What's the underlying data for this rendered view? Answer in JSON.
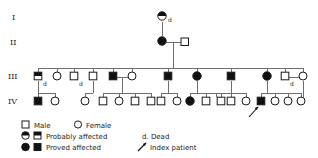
{
  "figure": {
    "type": "pedigree-chart",
    "width": 318,
    "height": 158,
    "background_color": "#ffffff",
    "line_color": "#6e6e6e",
    "symbol_stroke_color": "#1a1a1a",
    "filled_color": "#111111"
  },
  "generation_labels": [
    {
      "id": "gen-I",
      "text": "I",
      "x": 13,
      "y": 20
    },
    {
      "id": "gen-II",
      "text": "II",
      "x": 12,
      "y": 45
    },
    {
      "id": "gen-III",
      "text": "III",
      "x": 10,
      "y": 78
    },
    {
      "id": "gen-IV",
      "text": "IV",
      "x": 10,
      "y": 103
    }
  ],
  "dead_marks": [
    {
      "text": "d",
      "x": 168,
      "y": 21
    },
    {
      "text": "d",
      "x": 43,
      "y": 84
    },
    {
      "text": "d",
      "x": 78,
      "y": 84
    },
    {
      "text": "d",
      "x": 288,
      "y": 84
    }
  ],
  "individuals": [
    {
      "id": "I-1",
      "generation": "I",
      "sex": "female",
      "status": "probably-affected",
      "x": 162,
      "y": 16,
      "dead": true
    },
    {
      "id": "II-1",
      "generation": "II",
      "sex": "female",
      "status": "proved-affected",
      "x": 162,
      "y": 41,
      "dead": false
    },
    {
      "id": "II-2",
      "generation": "II",
      "sex": "male",
      "status": "unaffected",
      "x": 185,
      "y": 41,
      "dead": false
    },
    {
      "id": "III-1",
      "generation": "III",
      "sex": "male",
      "status": "probably-affected",
      "x": 38,
      "y": 76,
      "dead": true
    },
    {
      "id": "III-2",
      "generation": "III",
      "sex": "female",
      "status": "unaffected",
      "x": 57,
      "y": 76,
      "dead": false
    },
    {
      "id": "III-3",
      "generation": "III",
      "sex": "male",
      "status": "unaffected",
      "x": 74,
      "y": 76,
      "dead": true
    },
    {
      "id": "III-4",
      "generation": "III",
      "sex": "male",
      "status": "unaffected",
      "x": 93,
      "y": 76,
      "dead": false
    },
    {
      "id": "III-5",
      "generation": "III",
      "sex": "male",
      "status": "proved-affected",
      "x": 113,
      "y": 76,
      "dead": false
    },
    {
      "id": "III-6",
      "generation": "III",
      "sex": "female",
      "status": "unaffected",
      "x": 132,
      "y": 76,
      "dead": false
    },
    {
      "id": "III-7",
      "generation": "III",
      "sex": "male",
      "status": "proved-affected",
      "x": 168,
      "y": 76,
      "dead": false
    },
    {
      "id": "III-8",
      "generation": "III",
      "sex": "female",
      "status": "proved-affected",
      "x": 197,
      "y": 76,
      "dead": false
    },
    {
      "id": "III-9",
      "generation": "III",
      "sex": "male",
      "status": "proved-affected",
      "x": 231,
      "y": 76,
      "dead": false
    },
    {
      "id": "III-10",
      "generation": "III",
      "sex": "female",
      "status": "proved-affected",
      "x": 267,
      "y": 76,
      "dead": false
    },
    {
      "id": "III-11",
      "generation": "III",
      "sex": "male",
      "status": "unaffected",
      "x": 285,
      "y": 76,
      "dead": true
    },
    {
      "id": "III-12",
      "generation": "III",
      "sex": "female",
      "status": "unaffected",
      "x": 303,
      "y": 76,
      "dead": false
    },
    {
      "id": "IV-1",
      "generation": "IV",
      "sex": "male",
      "status": "proved-affected",
      "x": 38,
      "y": 101,
      "dead": false
    },
    {
      "id": "IV-2",
      "generation": "IV",
      "sex": "female",
      "status": "unaffected",
      "x": 55,
      "y": 101,
      "dead": false
    },
    {
      "id": "IV-3",
      "generation": "IV",
      "sex": "female",
      "status": "unaffected",
      "x": 85,
      "y": 101,
      "dead": false
    },
    {
      "id": "IV-4",
      "generation": "IV",
      "sex": "male",
      "status": "unaffected",
      "x": 103,
      "y": 101,
      "dead": false
    },
    {
      "id": "IV-5",
      "generation": "IV",
      "sex": "female",
      "status": "unaffected",
      "x": 119,
      "y": 101,
      "dead": false
    },
    {
      "id": "IV-6",
      "generation": "IV",
      "sex": "male",
      "status": "unaffected",
      "x": 135,
      "y": 101,
      "dead": false
    },
    {
      "id": "IV-7",
      "generation": "IV",
      "sex": "male",
      "status": "unaffected",
      "x": 151,
      "y": 101,
      "dead": false
    },
    {
      "id": "IV-8",
      "generation": "IV",
      "sex": "male",
      "status": "unaffected",
      "x": 161,
      "y": 101,
      "dead": false
    },
    {
      "id": "IV-9",
      "generation": "IV",
      "sex": "female",
      "status": "unaffected",
      "x": 177,
      "y": 101,
      "dead": false
    },
    {
      "id": "IV-10",
      "generation": "IV",
      "sex": "female",
      "status": "proved-affected",
      "x": 190,
      "y": 101,
      "dead": false
    },
    {
      "id": "IV-11",
      "generation": "IV",
      "sex": "male",
      "status": "unaffected",
      "x": 206,
      "y": 101,
      "dead": false
    },
    {
      "id": "IV-12",
      "generation": "IV",
      "sex": "male",
      "status": "unaffected",
      "x": 221,
      "y": 101,
      "dead": false
    },
    {
      "id": "IV-13",
      "generation": "IV",
      "sex": "male",
      "status": "unaffected",
      "x": 216,
      "y": 101,
      "dead": false
    },
    {
      "id": "IV-14",
      "generation": "IV",
      "sex": "male",
      "status": "unaffected",
      "x": 231,
      "y": 101,
      "dead": false
    },
    {
      "id": "IV-15",
      "generation": "IV",
      "sex": "female",
      "status": "unaffected",
      "x": 246,
      "y": 101,
      "dead": false
    },
    {
      "id": "IV-16",
      "generation": "IV",
      "sex": "male",
      "status": "proved-affected",
      "x": 261,
      "y": 101,
      "dead": false,
      "index_patient": true
    },
    {
      "id": "IV-17",
      "generation": "IV",
      "sex": "female",
      "status": "unaffected",
      "x": 275,
      "y": 101,
      "dead": false
    },
    {
      "id": "IV-18",
      "generation": "IV",
      "sex": "female",
      "status": "unaffected",
      "x": 288,
      "y": 101,
      "dead": false
    },
    {
      "id": "IV-19",
      "generation": "IV",
      "sex": "female",
      "status": "unaffected",
      "x": 301,
      "y": 101,
      "dead": false
    },
    {
      "id": "IV-20",
      "generation": "IV",
      "sex": "female",
      "status": "unaffected",
      "x": 303,
      "y": 101,
      "dead": false
    }
  ],
  "index_patient": {
    "id": "IV-16",
    "arrow_from_x": 250,
    "arrow_from_y": 117,
    "arrow_to_x": 259,
    "arrow_to_y": 107
  },
  "legend": {
    "rows": [
      {
        "items": [
          {
            "symbol": "open-square",
            "label": "Male"
          },
          {
            "symbol": "open-circle",
            "label": "Female"
          }
        ]
      },
      {
        "items": [
          {
            "symbol": "half-circle-half-square",
            "label": "Probably affected"
          },
          {
            "symbol": "text-d",
            "label": "d. Dead"
          }
        ]
      },
      {
        "items": [
          {
            "symbol": "filled-circle-filled-square",
            "label": "Proved affected"
          },
          {
            "symbol": "arrow",
            "label": "Index patient"
          }
        ]
      }
    ],
    "male_label": "Male",
    "female_label": "Female",
    "probably_affected_label": "Probably affected",
    "proved_affected_label": "Proved affected",
    "dead_label": "d. Dead",
    "index_patient_label": "Index patient"
  }
}
